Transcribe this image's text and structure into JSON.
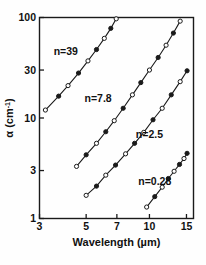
{
  "chart_data": {
    "type": "line",
    "title": "",
    "xlabel": "Wavelength (µm)",
    "ylabel": "α (cm⁻¹)",
    "ylabel_main": "α (cm",
    "ylabel_sup": "-1",
    "ylabel_tail": ")",
    "xscale": "log",
    "yscale": "log",
    "xlim": [
      3,
      16.2
    ],
    "ylim": [
      1,
      100
    ],
    "grid": false,
    "legend": "inline-annotations",
    "xticks": [
      3,
      5,
      7,
      10,
      15
    ],
    "xticklabels": [
      "3",
      "5",
      "7",
      "10",
      "15"
    ],
    "yticks": [
      1,
      3,
      10,
      30,
      100
    ],
    "yticklabels": [
      "1",
      "3",
      "10",
      "30",
      "100"
    ],
    "marker": "circle",
    "line_color": "#1a1a1a",
    "marker_edge_color": "#1a1a1a",
    "series": [
      {
        "name": "n=39",
        "label": "n=39",
        "label_x": 4.0,
        "label_y": 42.0,
        "x": [
          3.2,
          3.7,
          4.1,
          4.6,
          5.1,
          5.6,
          6.1,
          6.55,
          6.95
        ],
        "y": [
          12.0,
          16.5,
          21.0,
          28.0,
          37.0,
          48.0,
          62.0,
          78.0,
          97.0
        ]
      },
      {
        "name": "n=7.8",
        "label": "n=7.8",
        "label_x": 5.7,
        "label_y": 14.5,
        "x": [
          4.5,
          5.0,
          5.6,
          6.2,
          6.8,
          7.5,
          8.3,
          9.1,
          10.0,
          11.0,
          12.0,
          13.0,
          14.0
        ],
        "y": [
          3.3,
          4.3,
          5.6,
          7.3,
          9.4,
          12.5,
          17.0,
          22.5,
          30.0,
          40.0,
          53.0,
          70.0,
          92.0
        ]
      },
      {
        "name": "n=2.5",
        "label": "n=2.5",
        "label_x": 10.0,
        "label_y": 6.3,
        "x": [
          5.0,
          5.6,
          6.2,
          6.9,
          7.7,
          8.5,
          9.4,
          10.4,
          11.5,
          12.7,
          14.0,
          15.1
        ],
        "y": [
          1.7,
          2.1,
          2.7,
          3.4,
          4.4,
          5.6,
          7.2,
          9.6,
          12.5,
          17.0,
          23.0,
          29.5
        ]
      },
      {
        "name": "n=0.28",
        "label": "n=0.28",
        "label_x": 10.6,
        "label_y": 2.15,
        "x": [
          9.7,
          10.6,
          11.5,
          12.3,
          13.1,
          13.9,
          14.6,
          15.1
        ],
        "y": [
          1.3,
          1.65,
          2.05,
          2.5,
          2.95,
          3.45,
          3.95,
          4.45
        ]
      }
    ]
  }
}
